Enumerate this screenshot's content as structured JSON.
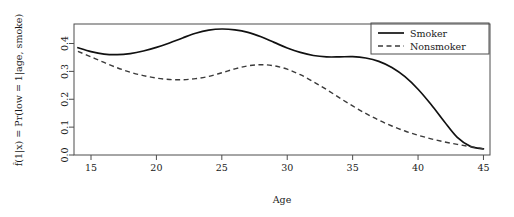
{
  "chart_data": {
    "type": "line",
    "title": "",
    "xlabel": "Age",
    "ylabel": "f̂(1|x) = Pr(low = 1|age, smoke)",
    "xlim": [
      13.7,
      45.5
    ],
    "ylim": [
      0.0,
      0.47
    ],
    "grid": false,
    "legend_position": "top-right",
    "xticks": [
      "15",
      "20",
      "25",
      "30",
      "35",
      "40",
      "45"
    ],
    "xtick_values": [
      15,
      20,
      25,
      30,
      35,
      40,
      45
    ],
    "yticks": [
      "0.0",
      "0.1",
      "0.2",
      "0.3",
      "0.4"
    ],
    "ytick_values": [
      0.0,
      0.1,
      0.2,
      0.3,
      0.4
    ],
    "x": [
      14,
      15,
      16,
      17,
      18,
      19,
      20,
      21,
      22,
      23,
      24,
      25,
      26,
      27,
      28,
      29,
      30,
      31,
      32,
      33,
      34,
      35,
      36,
      37,
      38,
      39,
      40,
      41,
      42,
      43,
      44,
      45
    ],
    "series": [
      {
        "name": "Smoker",
        "style": "solid",
        "color": "#111111",
        "values": [
          0.385,
          0.371,
          0.362,
          0.36,
          0.364,
          0.373,
          0.386,
          0.402,
          0.42,
          0.437,
          0.448,
          0.452,
          0.449,
          0.44,
          0.424,
          0.404,
          0.384,
          0.368,
          0.357,
          0.352,
          0.352,
          0.353,
          0.348,
          0.336,
          0.314,
          0.281,
          0.236,
          0.181,
          0.12,
          0.063,
          0.031,
          0.022
        ]
      },
      {
        "name": "Nonsmoker",
        "style": "dashed",
        "color": "#3a3a3a",
        "values": [
          0.372,
          0.352,
          0.332,
          0.313,
          0.297,
          0.285,
          0.276,
          0.271,
          0.27,
          0.274,
          0.282,
          0.295,
          0.309,
          0.32,
          0.324,
          0.32,
          0.308,
          0.288,
          0.263,
          0.235,
          0.205,
          0.176,
          0.149,
          0.125,
          0.104,
          0.086,
          0.071,
          0.058,
          0.047,
          0.038,
          0.03,
          0.023
        ]
      }
    ]
  },
  "legend": {
    "entries": [
      {
        "label": "Smoker"
      },
      {
        "label": "Nonsmoker"
      }
    ]
  },
  "axes": {
    "x_title": "Age",
    "y_title": "f̂(1|x) = Pr(low = 1|age, smoke)"
  }
}
